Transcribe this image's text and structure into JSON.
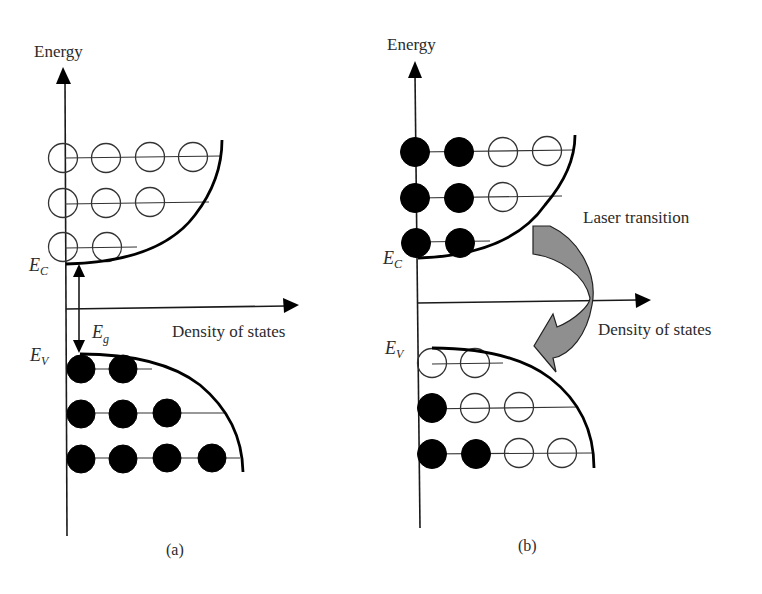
{
  "figure": {
    "colors": {
      "line": "#000000",
      "text": "#2b2b2b",
      "arrow_fill": "#8f8f8f",
      "background": "#ffffff"
    },
    "panels": [
      {
        "id": "a",
        "caption": "(a)",
        "y_axis_label": "Energy",
        "x_axis_label": "Density of states",
        "labels": {
          "conduction_edge": {
            "main": "E",
            "sub": "C"
          },
          "valence_edge": {
            "main": "E",
            "sub": "V"
          },
          "band_gap": {
            "main": "E",
            "sub": "g"
          }
        },
        "conduction_band": {
          "rows": [
            {
              "states": [
                "empty",
                "empty",
                "empty",
                "empty"
              ]
            },
            {
              "states": [
                "empty",
                "empty",
                "empty"
              ]
            },
            {
              "states": [
                "empty",
                "empty"
              ]
            }
          ]
        },
        "valence_band": {
          "rows": [
            {
              "states": [
                "filled",
                "filled"
              ]
            },
            {
              "states": [
                "filled",
                "filled",
                "filled"
              ]
            },
            {
              "states": [
                "filled",
                "filled",
                "filled",
                "filled"
              ]
            }
          ]
        }
      },
      {
        "id": "b",
        "caption": "(b)",
        "y_axis_label": "Energy",
        "x_axis_label": "Density of states",
        "annotation": "Laser transition",
        "labels": {
          "conduction_edge": {
            "main": "E",
            "sub": "C"
          },
          "valence_edge": {
            "main": "E",
            "sub": "V"
          }
        },
        "conduction_band": {
          "rows": [
            {
              "states": [
                "filled",
                "filled",
                "empty",
                "empty"
              ]
            },
            {
              "states": [
                "filled",
                "filled",
                "empty"
              ]
            },
            {
              "states": [
                "filled",
                "filled"
              ]
            }
          ]
        },
        "valence_band": {
          "rows": [
            {
              "states": [
                "empty",
                "empty"
              ]
            },
            {
              "states": [
                "filled",
                "empty",
                "empty"
              ]
            },
            {
              "states": [
                "filled",
                "filled",
                "empty",
                "empty"
              ]
            }
          ]
        }
      }
    ]
  }
}
